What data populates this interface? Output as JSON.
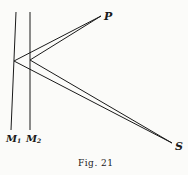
{
  "figure": {
    "caption": "Fig. 21",
    "labels": {
      "P": "P",
      "S": "S",
      "M1": "M",
      "M1_sub": "1",
      "M2": "M",
      "M2_sub": "2"
    },
    "line_color": "#1a1a1a",
    "background": "#fbfbf9"
  }
}
